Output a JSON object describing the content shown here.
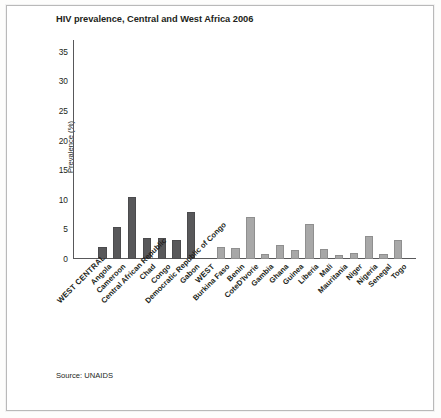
{
  "figure": {
    "source_note": "Source: UNAIDS"
  },
  "chart_data": {
    "type": "bar",
    "title": "HIV prevalence, Central and West Africa 2006",
    "xlabel": "",
    "ylabel": "Prevalence (%)",
    "ylim": [
      0,
      37
    ],
    "yticks": [
      0,
      5,
      10,
      15,
      20,
      25,
      30,
      35
    ],
    "grid": false,
    "legend": false,
    "categories": [
      "WEST CENTRAL",
      "Angola",
      "Cameroon",
      "Central African Republic",
      "Chad",
      "Congo",
      "Democratic Republic of Congo",
      "Gabon",
      "WEST",
      "Burkina Faso",
      "Benin",
      "CoteD'Ivorie",
      "Gambia",
      "Ghana",
      "Guinea",
      "Liberia",
      "Mali",
      "Mauritania",
      "Niger",
      "Nigeria",
      "Senegal",
      "Togo"
    ],
    "values": [
      null,
      2.1,
      5.4,
      10.4,
      3.5,
      3.5,
      3.2,
      7.9,
      null,
      2.0,
      1.8,
      7.1,
      0.9,
      2.3,
      1.5,
      5.9,
      1.7,
      0.7,
      1.1,
      3.9,
      0.9,
      3.2
    ],
    "groups": [
      "central",
      "central",
      "central",
      "central",
      "central",
      "central",
      "central",
      "central",
      "west",
      "west",
      "west",
      "west",
      "west",
      "west",
      "west",
      "west",
      "west",
      "west",
      "west",
      "west",
      "west",
      "west"
    ],
    "colors": {
      "central": "#58585a",
      "west": "#a8a8a8",
      "axis": "#58585a",
      "text": "#231f20"
    }
  }
}
